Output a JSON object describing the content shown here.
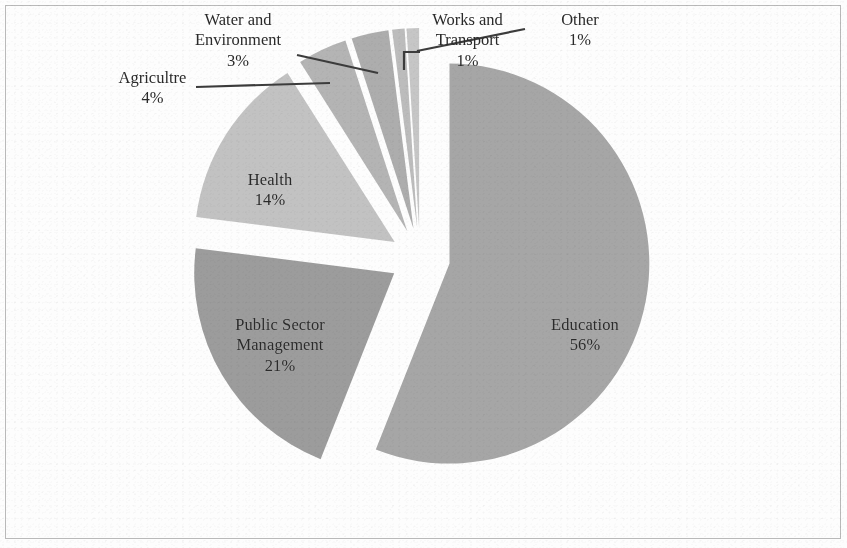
{
  "chart_data": {
    "type": "pie",
    "title": "",
    "subtitle": "",
    "legend_position": "none",
    "grid": false,
    "exploded": true,
    "units": "percent",
    "categories": [
      "Education",
      "Public Sector Management",
      "Health",
      "Agricultre",
      "Water and Environment",
      "Works and Transport",
      "Other"
    ],
    "values": [
      56,
      21,
      14,
      4,
      3,
      1,
      1
    ],
    "labels": [
      "Education\n56%",
      "Public Sector Management\n21%",
      "Health\n14%",
      "Agricultre\n4%",
      "Water and Environment\n3%",
      "Works and Transport\n1%",
      "Other\n1%"
    ],
    "colors": [
      "#a6a6a6",
      "#9c9c9c",
      "#c2c2c2",
      "#b4b4b4",
      "#adadad",
      "#bcbcbc",
      "#c6c6c6"
    ]
  },
  "chart": {
    "slices": [
      {
        "name": "Education",
        "value": "56%",
        "color": "#a6a6a6",
        "label_placement": "inside"
      },
      {
        "name": "Public Sector Management",
        "value": "21%",
        "color": "#9c9c9c",
        "label_placement": "inside"
      },
      {
        "name": "Health",
        "value": "14%",
        "color": "#c2c2c2",
        "label_placement": "inside"
      },
      {
        "name": "Agricultre",
        "value": "4%",
        "color": "#b4b4b4",
        "label_placement": "outside"
      },
      {
        "name": "Water and Environment",
        "value": "3%",
        "color": "#adadad",
        "label_placement": "outside"
      },
      {
        "name": "Works and Transport",
        "value": "1%",
        "color": "#bcbcbc",
        "label_placement": "outside"
      },
      {
        "name": "Other",
        "value": "1%",
        "color": "#c6c6c6",
        "label_placement": "outside"
      }
    ],
    "labels": {
      "education": {
        "name": "Education",
        "value": "56%"
      },
      "public_sector": {
        "name_line1": "Public Sector",
        "name_line2": "Management",
        "value": "21%"
      },
      "health": {
        "name": "Health",
        "value": "14%"
      },
      "agriculture": {
        "name": "Agricultre",
        "value": "4%"
      },
      "water": {
        "name_line1": "Water and",
        "name_line2": "Environment",
        "value": "3%"
      },
      "works": {
        "name_line1": "Works and",
        "name_line2": "Transport",
        "value": "1%"
      },
      "other": {
        "name": "Other",
        "value": "1%"
      }
    },
    "colors": {
      "leader_line": "#3c3c3c",
      "border": "#b9b9b9",
      "background": "#fdfdfd",
      "text": "#2a2a2a"
    }
  }
}
